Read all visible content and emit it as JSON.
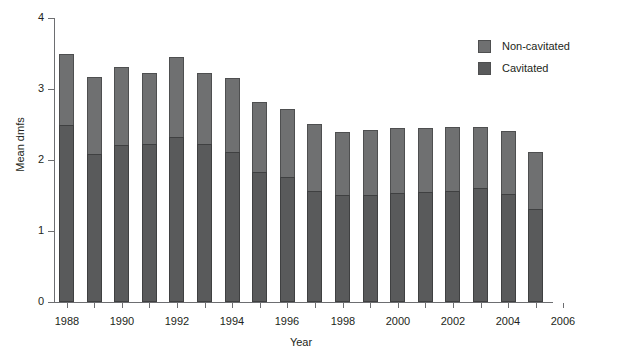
{
  "chart_data": {
    "type": "bar",
    "title": "",
    "xlabel": "Year",
    "ylabel": "Mean dmfs",
    "xlim": [
      1987.5,
      2006
    ],
    "ylim": [
      0,
      4
    ],
    "ytick_labels": [
      "0",
      "1",
      "2",
      "3",
      "4"
    ],
    "ytick_values": [
      0,
      1,
      2,
      3,
      4
    ],
    "xtick_labels": [
      "1988",
      "1990",
      "1992",
      "1994",
      "1996",
      "1998",
      "2000",
      "2002",
      "2004",
      "2006"
    ],
    "xtick_values": [
      1988,
      1990,
      1992,
      1994,
      1996,
      1998,
      2000,
      2002,
      2004,
      2006
    ],
    "grid": false,
    "stacked": true,
    "legend_position": "top-right",
    "categories": [
      1988,
      1989,
      1990,
      1991,
      1992,
      1993,
      1994,
      1995,
      1996,
      1997,
      1998,
      1999,
      2000,
      2001,
      2002,
      2003,
      2004,
      2005
    ],
    "series": [
      {
        "name": "Cavitated",
        "color": "#595a5b",
        "values": [
          2.49,
          2.08,
          2.21,
          2.23,
          2.32,
          2.23,
          2.11,
          1.83,
          1.76,
          1.56,
          1.5,
          1.51,
          1.54,
          1.55,
          1.57,
          1.61,
          1.52,
          1.31
        ]
      },
      {
        "name": "Non-cavitated",
        "color": "#6f7071",
        "values": [
          1.01,
          1.09,
          1.1,
          1.0,
          1.13,
          1.0,
          1.04,
          0.99,
          0.96,
          0.95,
          0.9,
          0.91,
          0.91,
          0.9,
          0.9,
          0.86,
          0.89,
          0.8
        ]
      }
    ],
    "totals": [
      3.5,
      3.17,
      3.31,
      3.23,
      3.45,
      3.23,
      3.15,
      2.82,
      2.72,
      2.51,
      2.4,
      2.42,
      2.45,
      2.45,
      2.47,
      2.47,
      2.41,
      2.11
    ]
  },
  "legend": {
    "items": [
      {
        "label": "Non-cavitated",
        "color": "#6f7071"
      },
      {
        "label": "Cavitated",
        "color": "#595a5b"
      }
    ]
  },
  "axes": {
    "y_title": "Mean dmfs",
    "x_title": "Year"
  }
}
